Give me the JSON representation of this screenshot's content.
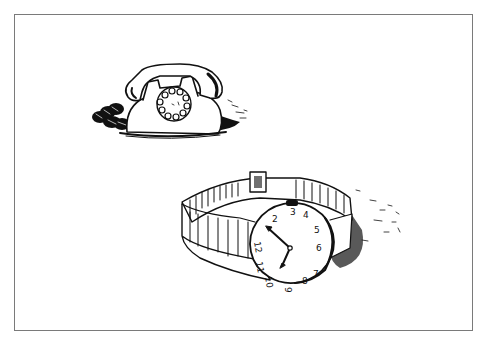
{
  "illustration": {
    "caption": "Ink sketch of a rotary telephone and a wristwatch",
    "objects": [
      {
        "name": "rotary-telephone",
        "dial_holes": 10
      },
      {
        "name": "wristwatch",
        "dial_numbers": [
          "12",
          "1",
          "2",
          "3",
          "4",
          "5",
          "6",
          "7",
          "8",
          "9",
          "10",
          "11"
        ],
        "hands": "approximately 10:35"
      }
    ],
    "colors": {
      "ink": "#111111",
      "frame": "#7a7a7a",
      "paper": "#ffffff"
    }
  }
}
